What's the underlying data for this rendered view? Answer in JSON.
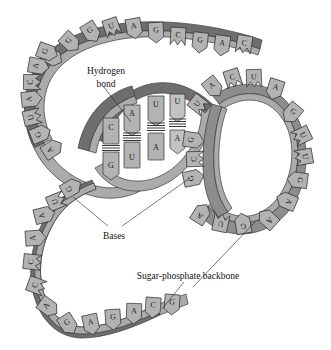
{
  "figure": {
    "width": 331,
    "height": 350,
    "background": "#ffffff"
  },
  "colors": {
    "ribbon_dark": "#6e6e6e",
    "ribbon_mid": "#8d8d8d",
    "ribbon_light": "#ababab",
    "base_fill": "#b3b3b3",
    "outline": "#2e2e2e",
    "text": "#121212"
  },
  "labels": {
    "hydrogen_bond_line1": "Hydrogen",
    "hydrogen_bond_line2": "bond",
    "bases": "Bases",
    "backbone": "Sugar-phosphate backbone"
  },
  "legend_icons": {
    "hydrogen_bond_icon": "hbond-rungs-icon",
    "base_icon": "pentagon-base-icon",
    "backbone_icon": "ribbon-strand-icon"
  },
  "bases": {
    "top_arc": [
      {
        "letter": "A",
        "x": 52,
        "y": 57,
        "rot": -62,
        "notch": false
      },
      {
        "letter": "G",
        "x": 70,
        "y": 42,
        "rot": -47,
        "notch": false
      },
      {
        "letter": "G",
        "x": 91,
        "y": 32,
        "rot": -32,
        "notch": false
      },
      {
        "letter": "U",
        "x": 112,
        "y": 28,
        "rot": -19,
        "notch": true
      },
      {
        "letter": "A",
        "x": 134,
        "y": 28,
        "rot": -10,
        "notch": false
      },
      {
        "letter": "G",
        "x": 156,
        "y": 32,
        "rot": -3,
        "notch": false
      },
      {
        "letter": "C",
        "x": 178,
        "y": 37,
        "rot": 3,
        "notch": true
      },
      {
        "letter": "G",
        "x": 200,
        "y": 42,
        "rot": 6,
        "notch": false
      },
      {
        "letter": "A",
        "x": 222,
        "y": 45,
        "rot": 8,
        "notch": false
      },
      {
        "letter": "C",
        "x": 244,
        "y": 45,
        "rot": 9,
        "notch": true
      }
    ],
    "left_descend": [
      {
        "letter": "G",
        "x": 47,
        "y": 52,
        "rot": -70,
        "notch": false
      },
      {
        "letter": "A",
        "x": 38,
        "y": 66,
        "rot": -80,
        "notch": false
      },
      {
        "letter": "C",
        "x": 33,
        "y": 82,
        "rot": -90,
        "notch": true
      },
      {
        "letter": "A",
        "x": 31,
        "y": 99,
        "rot": -96,
        "notch": false
      },
      {
        "letter": "U",
        "x": 33,
        "y": 117,
        "rot": -103,
        "notch": true
      },
      {
        "letter": "G",
        "x": 40,
        "y": 134,
        "rot": -112,
        "notch": false
      },
      {
        "letter": "A",
        "x": 52,
        "y": 149,
        "rot": -122,
        "notch": false
      }
    ],
    "helix_pairs": [
      {
        "top": "C",
        "bottom": "G",
        "x": 111,
        "top_y": 126,
        "bottom_y": 165,
        "bond_y": 146
      },
      {
        "top": "A",
        "bottom": "U",
        "x": 132,
        "top_y": 113,
        "bottom_y": 155,
        "bond_y": 136
      },
      {
        "top": "U",
        "bottom": "A",
        "x": 156,
        "top_y": 105,
        "bottom_y": 146,
        "bond_y": 128
      },
      {
        "top": "U",
        "bottom": "A",
        "x": 177,
        "top_y": 101,
        "bottom_y": 140,
        "bond_y": 122
      }
    ],
    "right_loop_top": [
      {
        "letter": "U",
        "x": 199,
        "y": 105,
        "rot": -52,
        "notch": true
      },
      {
        "letter": "A",
        "x": 213,
        "y": 87,
        "rot": -38,
        "notch": false
      },
      {
        "letter": "C",
        "x": 233,
        "y": 79,
        "rot": -18,
        "notch": true
      },
      {
        "letter": "U",
        "x": 254,
        "y": 79,
        "rot": -2,
        "notch": true
      },
      {
        "letter": "A",
        "x": 275,
        "y": 89,
        "rot": 18,
        "notch": false
      }
    ],
    "right_loop_side": [
      {
        "letter": "G",
        "x": 292,
        "y": 113,
        "rot": 40,
        "notch": false
      },
      {
        "letter": "U",
        "x": 301,
        "y": 136,
        "rot": 64,
        "notch": true
      },
      {
        "letter": "U",
        "x": 303,
        "y": 157,
        "rot": 80,
        "notch": true
      },
      {
        "letter": "G",
        "x": 298,
        "y": 180,
        "rot": 97,
        "notch": false
      },
      {
        "letter": "A",
        "x": 287,
        "y": 201,
        "rot": 113,
        "notch": false
      },
      {
        "letter": "A",
        "x": 268,
        "y": 219,
        "rot": 132,
        "notch": false
      }
    ],
    "right_loop_bottom": [
      {
        "letter": "G",
        "x": 243,
        "y": 224,
        "rot": 170,
        "notch": false
      },
      {
        "letter": "U",
        "x": 221,
        "y": 222,
        "rot": 192,
        "notch": true
      },
      {
        "letter": "A",
        "x": 201,
        "y": 214,
        "rot": 212,
        "notch": false
      }
    ],
    "right_loop_inner": [
      {
        "letter": "G",
        "x": 193,
        "y": 178,
        "rot": 258,
        "notch": false
      },
      {
        "letter": "C",
        "x": 196,
        "y": 159,
        "rot": 268,
        "notch": true
      },
      {
        "letter": "G",
        "x": 193,
        "y": 140,
        "rot": 278,
        "notch": false
      }
    ],
    "left_loop": [
      {
        "letter": "G",
        "x": 71,
        "y": 188,
        "rot": -120,
        "notch": false
      },
      {
        "letter": "U",
        "x": 57,
        "y": 201,
        "rot": -112,
        "notch": true
      },
      {
        "letter": "A",
        "x": 44,
        "y": 215,
        "rot": -104,
        "notch": false
      },
      {
        "letter": "A",
        "x": 35,
        "y": 238,
        "rot": -94,
        "notch": false
      },
      {
        "letter": "C",
        "x": 33,
        "y": 262,
        "rot": -84,
        "notch": true
      },
      {
        "letter": "C",
        "x": 37,
        "y": 286,
        "rot": -70,
        "notch": true
      },
      {
        "letter": "A",
        "x": 48,
        "y": 307,
        "rot": -54,
        "notch": false
      },
      {
        "letter": "G",
        "x": 68,
        "y": 324,
        "rot": -32,
        "notch": false
      }
    ],
    "bottom_arc": [
      {
        "letter": "A",
        "x": 91,
        "y": 324,
        "rot": -12,
        "notch": false
      },
      {
        "letter": "G",
        "x": 113,
        "y": 319,
        "rot": -4,
        "notch": false
      },
      {
        "letter": "A",
        "x": 134,
        "y": 313,
        "rot": 2,
        "notch": false
      },
      {
        "letter": "C",
        "x": 153,
        "y": 307,
        "rot": 4,
        "notch": false
      },
      {
        "letter": "G",
        "x": 172,
        "y": 304,
        "rot": 4,
        "notch": false
      }
    ]
  }
}
